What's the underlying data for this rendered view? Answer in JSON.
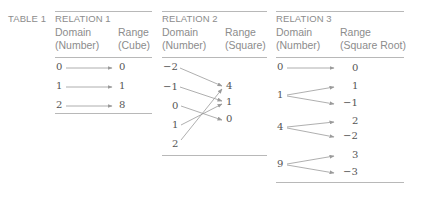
{
  "table_label": "TABLE 1",
  "relations": [
    {
      "title": "RELATION 1",
      "domain_header": [
        "Domain",
        "(Number)"
      ],
      "range_header": [
        "Range",
        "(Cube)"
      ],
      "domain": [
        "0",
        "1",
        "2"
      ],
      "range": [
        "0",
        "1",
        "8"
      ],
      "mapping": [
        [
          "0",
          "0"
        ],
        [
          "1",
          "1"
        ],
        [
          "2",
          "8"
        ]
      ]
    },
    {
      "title": "RELATION 2",
      "domain_header": [
        "Domain",
        "(Number)"
      ],
      "range_header": [
        "Range",
        "(Square)"
      ],
      "domain": [
        "−2",
        "−1",
        "0",
        "1",
        "2"
      ],
      "range": [
        "4",
        "1",
        "0"
      ],
      "mapping": [
        [
          "-2",
          "4"
        ],
        [
          "-1",
          "1"
        ],
        [
          "0",
          "0"
        ],
        [
          "1",
          "1"
        ],
        [
          "2",
          "4"
        ]
      ]
    },
    {
      "title": "RELATION 3",
      "domain_header": [
        "Domain",
        "(Number)"
      ],
      "range_header": [
        "Range",
        "(Square Root)"
      ],
      "domain": [
        "0",
        "1",
        "4",
        "9"
      ],
      "range": [
        "0",
        "1",
        "−1",
        "2",
        "−2",
        "3",
        "−3"
      ],
      "mapping": [
        [
          "0",
          "0"
        ],
        [
          "1",
          "1"
        ],
        [
          "1",
          "-1"
        ],
        [
          "4",
          "2"
        ],
        [
          "4",
          "-2"
        ],
        [
          "9",
          "3"
        ],
        [
          "9",
          "-3"
        ]
      ]
    }
  ],
  "colors": {
    "text": "#8c8c8c",
    "numbers": "#555555",
    "rules": "#b8b8b8",
    "arrows": "#9a9a9a"
  }
}
